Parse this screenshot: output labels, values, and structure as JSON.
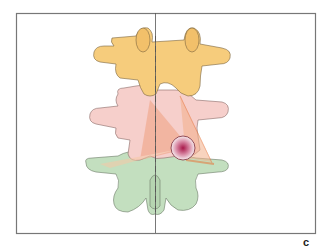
{
  "figure": {
    "panel_label": "c",
    "colors": {
      "upper_vertebra": "#f6cc7c",
      "middle_vertebra": "#f6cfcb",
      "lower_vertebra": "#c3dfbf",
      "outline": "#6b5a4a",
      "frame": "#777777",
      "midline": "#555555",
      "trajectory": "#e8743a",
      "lesion_center": "#a8184a",
      "lesion_edge": "#f3e8ea"
    },
    "vertebrae": [
      {
        "name": "upper",
        "color_key": "upper_vertebra"
      },
      {
        "name": "middle",
        "color_key": "middle_vertebra"
      },
      {
        "name": "lower",
        "color_key": "lower_vertebra"
      }
    ],
    "lesion": {
      "cx": 183,
      "cy": 148,
      "r": 12
    }
  }
}
